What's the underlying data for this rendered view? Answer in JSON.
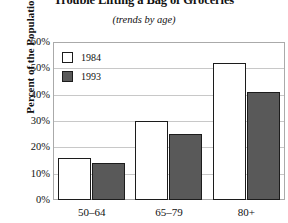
{
  "chart_data": {
    "type": "bar",
    "title": "Trouble Lifting a Bag of Groceries",
    "subtitle": "(trends by age)",
    "xlabel": "",
    "ylabel": "Percent of the Population",
    "categories": [
      "50–64",
      "65–79",
      "80+"
    ],
    "series": [
      {
        "name": "1984",
        "values": [
          16,
          30,
          52
        ],
        "color": "#ffffff"
      },
      {
        "name": "1993",
        "values": [
          14,
          25,
          41
        ],
        "color": "#595959"
      }
    ],
    "ylim": [
      0,
      60
    ],
    "ytick_values": [
      60,
      50,
      40,
      30,
      20,
      10,
      0
    ],
    "yticklabels": [
      "60%",
      "50%",
      "40%",
      "30%",
      "20%",
      "10%",
      "0%"
    ],
    "grid": true,
    "legend_position": "top-left",
    "axis_border_color": "#aaaaaa",
    "gridline_color": "#c8c8c8",
    "bar_outline_color": "#1c1c1c"
  }
}
